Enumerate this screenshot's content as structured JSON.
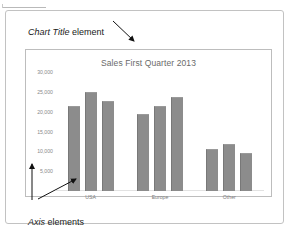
{
  "annotations": {
    "title_annotation": {
      "emphasis": "Chart Title",
      "rest": " element"
    },
    "axis_annotation": {
      "emphasis": "Axis",
      "rest": " elements"
    }
  },
  "chart_data": {
    "type": "bar",
    "title": "Sales First Quarter 2013",
    "xlabel": "",
    "ylabel": "",
    "categories": [
      "USA",
      "Europe",
      "Other"
    ],
    "series": [
      {
        "name": "Series 1",
        "values": [
          21500,
          19300,
          10600
        ]
      },
      {
        "name": "Series 2",
        "values": [
          25000,
          21500,
          11900
        ]
      },
      {
        "name": "Series 3",
        "values": [
          22700,
          23700,
          9700
        ]
      }
    ],
    "ylim": [
      0,
      30000
    ],
    "yticks": [
      30000,
      25000,
      20000,
      15000,
      10000,
      5000
    ],
    "ytick_labels": [
      "30,000",
      "25,000",
      "20,000",
      "15,000",
      "10,000",
      "5,000"
    ],
    "grid": false,
    "legend": "none",
    "bar_color": "#8c8c8c",
    "title_color": "#6a6a6a",
    "tick_color": "#8a8a8a"
  }
}
